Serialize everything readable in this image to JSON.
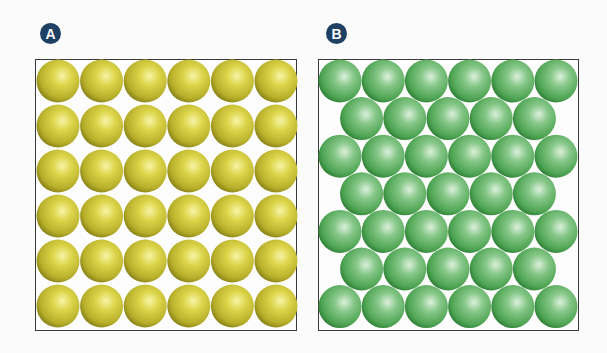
{
  "panels": [
    {
      "id": "A",
      "label": "A",
      "description": "simple square packing",
      "arrangement": "square",
      "rows": 6,
      "row_counts": [
        6,
        6,
        6,
        6,
        6,
        6
      ],
      "total_spheres": 36,
      "sphere_color": "#d4cc3a",
      "sphere_highlight": "#f6f29a",
      "sphere_shadow": "#8a8418"
    },
    {
      "id": "B",
      "label": "B",
      "description": "hexagonal close packing",
      "arrangement": "hexagonal",
      "rows": 7,
      "row_counts": [
        6,
        5,
        6,
        5,
        6,
        5,
        6
      ],
      "total_spheres": 39,
      "sphere_color": "#5fb062",
      "sphere_highlight": "#d2ecd2",
      "sphere_shadow": "#2c7d34"
    }
  ],
  "colors": {
    "badge": "#1d4063",
    "border": "#3a3a3a",
    "background": "#fbfbfb"
  }
}
